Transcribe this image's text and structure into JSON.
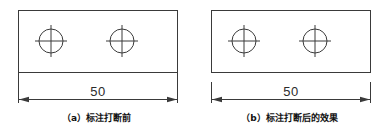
{
  "figure": {
    "type": "engineering-drawing-comparison",
    "background_color": "#ffffff",
    "line_color": "#3a3a3a",
    "text_color": "#2b2b2b",
    "width": 386,
    "height": 138
  },
  "panels": [
    {
      "id": "a",
      "caption": "（a）标注打断前",
      "part": {
        "shape": "rectangle",
        "holes": 2,
        "hole_marks": "center-crosshair"
      },
      "dimension": {
        "value": "50",
        "broken": false,
        "extension_lines_touch_part": true
      }
    },
    {
      "id": "b",
      "caption": "（b）标注打断后的效果",
      "part": {
        "shape": "rectangle",
        "holes": 2,
        "hole_marks": "center-crosshair"
      },
      "dimension": {
        "value": "50",
        "broken": true,
        "extension_lines_touch_part": false
      }
    }
  ]
}
